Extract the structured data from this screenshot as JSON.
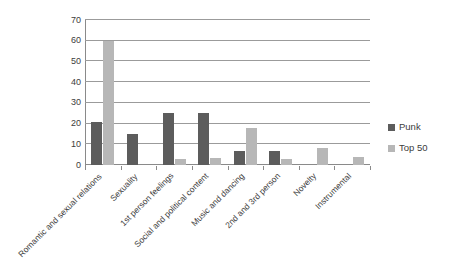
{
  "chart_data": {
    "type": "bar",
    "title": "",
    "subtitle": "",
    "xlabel": "",
    "ylabel": "",
    "ylim": [
      0,
      70
    ],
    "yticks": [
      0,
      10,
      20,
      30,
      40,
      50,
      60,
      70
    ],
    "grid": true,
    "grid_axis": "y",
    "legend_position": "right",
    "categories": [
      "Romantic and sexual relations",
      "Sexuality",
      "1st person feelings",
      "Social and political content",
      "Music and dancing",
      "2nd and 3rd person",
      "Novelty",
      "Instrumental"
    ],
    "series": [
      {
        "name": "Punk",
        "color": "#5c5c5c",
        "values": [
          21,
          15,
          25,
          25,
          7,
          7,
          0,
          0
        ]
      },
      {
        "name": "Top 50",
        "color": "#b7b7b7",
        "values": [
          60,
          0,
          3,
          3.5,
          18,
          3,
          8,
          4
        ]
      }
    ]
  },
  "legend": {
    "items": [
      {
        "label": "Punk",
        "swatch": "legend-swatch-punk"
      },
      {
        "label": "Top 50",
        "swatch": "legend-swatch-top50"
      }
    ]
  },
  "axis": {
    "y_tick_labels": [
      "0",
      "10",
      "20",
      "30",
      "40",
      "50",
      "60",
      "70"
    ]
  }
}
